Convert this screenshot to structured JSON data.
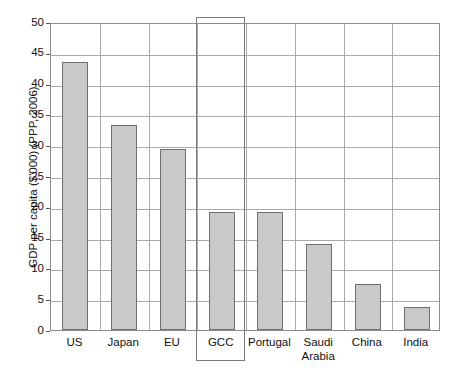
{
  "chart_data": {
    "type": "bar",
    "title": "",
    "subtitle": "",
    "xlabel": "",
    "ylabel": "GDP per capita ($'000) (PPP, 2006)",
    "categories": [
      "US",
      "Japan",
      "EU",
      "GCC",
      "Portugal",
      "Saudi\nArabia",
      "China",
      "India"
    ],
    "values": [
      43.5,
      33.3,
      29.4,
      19.2,
      19.2,
      14.0,
      7.5,
      3.8
    ],
    "ylim": [
      0,
      50
    ],
    "yticks": [
      0,
      5,
      10,
      15,
      20,
      25,
      30,
      35,
      40,
      45,
      50
    ],
    "ytick_labels": [
      "0",
      "5",
      "10",
      "15",
      "20",
      "25",
      "30",
      "35",
      "40",
      "45",
      "50"
    ],
    "grid": "horizontal-and-vertical",
    "legend": "none",
    "bar_color": "#c9c9c9",
    "bar_edge_color": "#6f6f6f",
    "gridline_color": "#a9a9a9",
    "axis_color": "#8c8c8c",
    "highlight": {
      "category": "GCC",
      "label": "GCC",
      "border_color": "#7a7a7a"
    },
    "annotations": []
  }
}
